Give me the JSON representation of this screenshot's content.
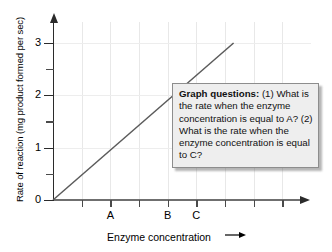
{
  "chart_data": {
    "type": "line",
    "title": "",
    "xlabel": "Enzyme concentration",
    "ylabel": "Rate of reaction (mg product formed per sec)",
    "xlabel_arrow": "→",
    "grid": true,
    "legend": null,
    "ylim": [
      0,
      3.4
    ],
    "xlim": [
      0,
      9
    ],
    "y_ticks_major": [
      {
        "value": 0,
        "label": "0"
      },
      {
        "value": 1,
        "label": "1"
      },
      {
        "value": 2,
        "label": "2"
      },
      {
        "value": 3,
        "label": "3"
      }
    ],
    "y_ticks_minor": [
      0.5,
      1.5,
      2.5
    ],
    "x_ticks": [
      {
        "value": 1,
        "label": ""
      },
      {
        "value": 2,
        "label": "A"
      },
      {
        "value": 3,
        "label": ""
      },
      {
        "value": 4,
        "label": "B"
      },
      {
        "value": 5,
        "label": "C"
      },
      {
        "value": 6,
        "label": ""
      },
      {
        "value": 7,
        "label": ""
      },
      {
        "value": 8,
        "label": ""
      }
    ],
    "series": [
      {
        "name": "rate vs enzyme concentration",
        "color": "#5b5b5b",
        "x": [
          0,
          6.3
        ],
        "y": [
          0,
          3.0
        ]
      }
    ]
  },
  "annotation": {
    "title": "Graph questions:",
    "body": " (1) What is the rate when the enzyme concentration is equal to A? (2) What is the rate when the enzyme concentration is equal to C?"
  },
  "icons": {
    "y_axis_arrow": "up-arrow-icon",
    "x_axis_arrow": "right-arrow-icon",
    "x_label_arrow": "right-arrow-icon"
  }
}
